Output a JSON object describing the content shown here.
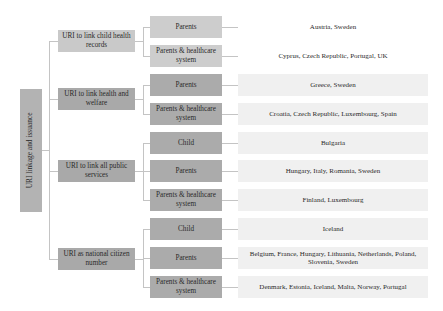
{
  "root": {
    "label": "URI linkage and issuance"
  },
  "groups": [
    {
      "label": "URI to link child health records",
      "items": [
        {
          "label": "Parents",
          "countries": "Austria, Sweden"
        },
        {
          "label": "Parents & healthcare system",
          "countries": "Cyprus, Czech Republic, Portugal, UK"
        }
      ]
    },
    {
      "label": "URI to link health and welfare",
      "items": [
        {
          "label": "Parents",
          "countries": "Greece, Sweden"
        },
        {
          "label": "Parents & healthcare system",
          "countries": "Croatia, Czech Republic, Luxembourg, Spain"
        }
      ]
    },
    {
      "label": "URI to link all public services",
      "items": [
        {
          "label": "Child",
          "countries": "Bulgaria"
        },
        {
          "label": "Parents",
          "countries": "Hungary, Italy, Romania, Sweden"
        },
        {
          "label": "Parents & healthcare system",
          "countries": "Finland, Luxembourg"
        }
      ]
    },
    {
      "label": "URI as national citizen number",
      "items": [
        {
          "label": "Child",
          "countries": "Iceland"
        },
        {
          "label": "Parents",
          "countries": "Belgium, France, Hungary, Lithuania, Netherlands, Poland, Slovenia, Sweden"
        },
        {
          "label": "Parents & healthcare system",
          "countries": "Denmark, Estonia, Iceland, Malta, Norway, Portugal"
        }
      ]
    }
  ],
  "colors": {
    "root": "#b3b3b3",
    "level1_light": "#c9c9c9",
    "level1_dark": "#a9a9a9",
    "level2_light": "#cdcdcd",
    "level2_dark": "#ababab",
    "country_bg": "#f0f0f0",
    "connector": "#c4c4c4"
  }
}
